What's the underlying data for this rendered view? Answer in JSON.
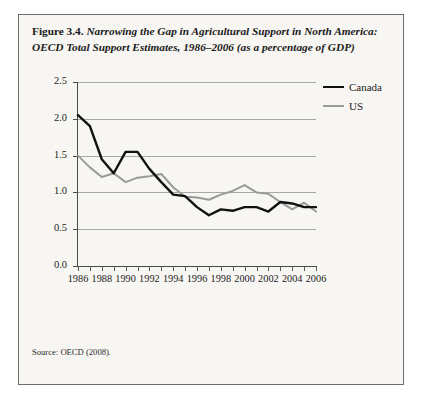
{
  "figure": {
    "number": "Figure 3.4.",
    "caption": "Narrowing the Gap in Agricultural Support in North America: OECD Total Support Estimates, 1986–2006 (as a percentage of GDP)",
    "source": "Source: OECD (2008)."
  },
  "legend": {
    "position": "right",
    "entries": [
      {
        "label": "Canada",
        "color": "#111111"
      },
      {
        "label": "US",
        "color": "#9a9a9a"
      }
    ]
  },
  "axis": {
    "y_ticks": [
      "0.0",
      "0.5",
      "1.0",
      "1.5",
      "2.0",
      "2.5"
    ],
    "x_ticks_labeled": [
      "1986",
      "1988",
      "1990",
      "1992",
      "1994",
      "1996",
      "1998",
      "2000",
      "2002",
      "2004",
      "2006"
    ]
  },
  "chart_data": {
    "type": "line",
    "title": "Narrowing the Gap in Agricultural Support in North America: OECD Total Support Estimates, 1986–2006 (as a percentage of GDP)",
    "xlabel": "",
    "ylabel": "",
    "xlim": [
      1986,
      2006
    ],
    "ylim": [
      0.0,
      2.5
    ],
    "ytick_step": 0.5,
    "grid": true,
    "legend_position": "right",
    "x": [
      1986,
      1987,
      1988,
      1989,
      1990,
      1991,
      1992,
      1993,
      1994,
      1995,
      1996,
      1997,
      1998,
      1999,
      2000,
      2001,
      2002,
      2003,
      2004,
      2005,
      2006
    ],
    "series": [
      {
        "name": "Canada",
        "color": "#111111",
        "values": [
          2.05,
          1.9,
          1.45,
          1.26,
          1.55,
          1.55,
          1.32,
          1.14,
          0.97,
          0.95,
          0.8,
          0.69,
          0.77,
          0.75,
          0.8,
          0.8,
          0.74,
          0.87,
          0.85,
          0.8,
          0.8
        ]
      },
      {
        "name": "US",
        "color": "#9a9a9a",
        "values": [
          1.5,
          1.34,
          1.21,
          1.26,
          1.14,
          1.2,
          1.22,
          1.25,
          1.07,
          0.94,
          0.93,
          0.9,
          0.97,
          1.02,
          1.1,
          1.0,
          0.98,
          0.87,
          0.77,
          0.86,
          0.74
        ]
      }
    ]
  }
}
